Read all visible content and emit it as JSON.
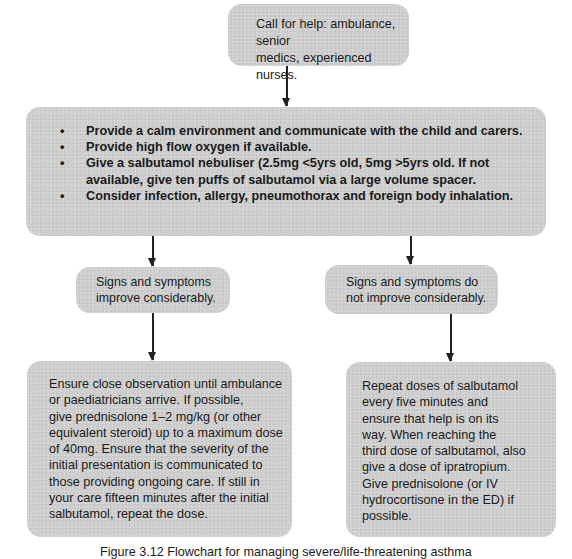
{
  "flowchart": {
    "start": {
      "text_lines": [
        "Call for help: ambulance, senior",
        "medics, experienced nurses."
      ]
    },
    "initial_actions": {
      "items": [
        "Provide a calm environment and communicate with the child and carers.",
        "Provide high flow oxygen if available.",
        "Give a salbutamol nebuliser (2.5mg <5yrs old, 5mg >5yrs old.  If not available, give ten puffs of salbutamol via a large volume spacer.",
        "Consider infection, allergy, pneumothorax and foreign body inhalation."
      ]
    },
    "branches": [
      {
        "condition_lines": [
          "Signs and symptoms",
          "improve considerably."
        ],
        "action_lines": [
          "Ensure close observation until ambulance",
          "or paediatricians arrive. If possible,",
          "give prednisolone 1–2 mg/kg (or other",
          "equivalent steroid) up to a maximum dose",
          "of 40mg. Ensure that the severity of the",
          "initial presentation is communicated to",
          "those providing ongoing care.  If still in",
          "your care fifteen minutes after the initial",
          "salbutamol, repeat the dose."
        ]
      },
      {
        "condition_lines": [
          "Signs and symptoms do",
          "not improve considerably."
        ],
        "action_lines": [
          "Repeat doses of salbutamol",
          "every five minutes and",
          "ensure that help is on its",
          "way.  When reaching the",
          "third dose of salbutamol, also",
          "give a dose of ipratropium.",
          "Give prednisolone (or IV",
          "hydrocortisone in the ED) if",
          "possible."
        ]
      }
    ]
  },
  "caption": "Figure 3.12 Flowchart for managing severe/life-threatening asthma",
  "colors": {
    "box_fill": "#cfcfcf",
    "connector": "#222222",
    "text": "#1a1a1a"
  }
}
